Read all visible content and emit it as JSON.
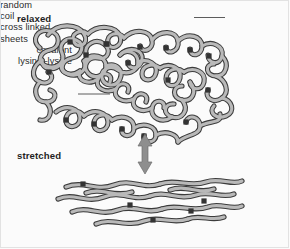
{
  "figure": {
    "width": 290,
    "height": 249,
    "background_color": "#fbfbfb",
    "border_color": "#e2e2e2"
  },
  "colors": {
    "ribbon_fill": "#b9b9b9",
    "ribbon_outline": "#3c3c3c",
    "crosslink": "#333333",
    "arrow": "#8e8e8e",
    "text": "#2b2b2b",
    "leader_line": "#4a4a4a"
  },
  "labels": {
    "relaxed": "relaxed",
    "stretched": "stretched",
    "random_coil_line1": "random",
    "random_coil_line2": "coil",
    "covalent_line1": "covalent",
    "covalent_line2": "lysine–lysine",
    "cross_linked_line1": "cross linked",
    "cross_linked_line2": "sheets"
  },
  "icons": {
    "double_headed_arrow": "double-headed-vertical-arrow",
    "crosslink_marker": "crosslink-square"
  },
  "diagram": {
    "type": "schematic",
    "states": [
      {
        "name": "relaxed",
        "description": "random coil polypeptide chains joined by covalent lysine-lysine crosslinks",
        "crosslink_count": 14
      },
      {
        "name": "stretched",
        "description": "cross linked sheets of extended chains aligned horizontally",
        "crosslink_count": 6
      }
    ]
  }
}
